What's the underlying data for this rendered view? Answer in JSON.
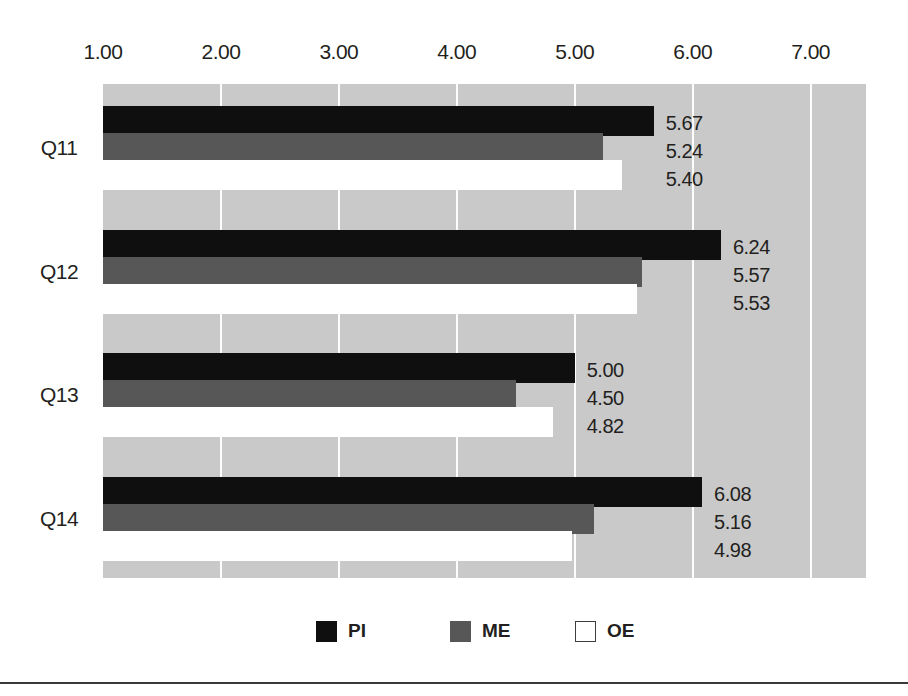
{
  "chart_data": {
    "type": "bar",
    "orientation": "horizontal",
    "title": "",
    "xlabel": "",
    "ylabel": "",
    "categories": [
      "Q11",
      "Q12",
      "Q13",
      "Q14"
    ],
    "series": [
      {
        "name": "PI",
        "color": "#100f0f",
        "values": [
          5.67,
          6.24,
          5.0,
          6.08
        ]
      },
      {
        "name": "ME",
        "color": "#575757",
        "values": [
          5.24,
          5.57,
          4.5,
          5.16
        ]
      },
      {
        "name": "OE",
        "color": "#ffffff",
        "values": [
          5.4,
          5.53,
          4.82,
          4.98
        ]
      }
    ],
    "value_labels": [
      [
        "5.67",
        "5.24",
        "5.40"
      ],
      [
        "6.24",
        "5.57",
        "5.53"
      ],
      [
        "5.00",
        "4.50",
        "4.82"
      ],
      [
        "6.08",
        "5.16",
        "4.98"
      ]
    ],
    "xticks": [
      "1.00",
      "2.00",
      "3.00",
      "4.00",
      "5.00",
      "6.00",
      "7.00"
    ],
    "xtick_values": [
      1,
      2,
      3,
      4,
      5,
      6,
      7
    ],
    "xlim": [
      1.0,
      7.47
    ],
    "grid": true,
    "gridline_color": "#fdfdfd",
    "plot_background": "#c9c9c9",
    "legend": {
      "position": "bottom",
      "entries": [
        {
          "label": "PI",
          "color": "#100f0f"
        },
        {
          "label": "ME",
          "color": "#575757"
        },
        {
          "label": "OE",
          "color": "#ffffff"
        }
      ]
    }
  }
}
